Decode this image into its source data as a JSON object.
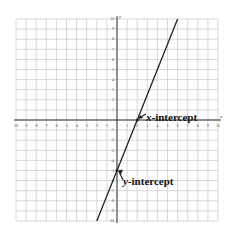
{
  "chart_data": {
    "type": "line",
    "title": "",
    "xlabel": "x",
    "ylabel": "y",
    "xlim": [
      -10,
      10
    ],
    "ylim": [
      -10,
      10
    ],
    "grid": true,
    "x_ticks": [
      -10,
      -9,
      -8,
      -7,
      -6,
      -5,
      -4,
      -3,
      -2,
      -1,
      1,
      2,
      3,
      4,
      5,
      6,
      7,
      8,
      9,
      10
    ],
    "y_ticks": [
      -10,
      -9,
      -8,
      -7,
      -6,
      -5,
      -4,
      -3,
      -2,
      -1,
      1,
      2,
      3,
      4,
      5,
      6,
      7,
      8,
      9,
      10
    ],
    "series": [
      {
        "name": "line",
        "equation": "y = 2.5x - 5",
        "x": [
          -2,
          6
        ],
        "y": [
          -10,
          10
        ]
      }
    ],
    "annotations": [
      {
        "text": "x-intercept",
        "point": [
          2,
          0
        ]
      },
      {
        "text": "y-intercept",
        "point": [
          0,
          -5
        ]
      }
    ]
  },
  "labels": {
    "x_intercept_var": "x",
    "x_intercept_rest": "-intercept",
    "y_intercept_var": "y",
    "y_intercept_rest": "-intercept",
    "x_axis": "x",
    "y_axis": "y"
  }
}
